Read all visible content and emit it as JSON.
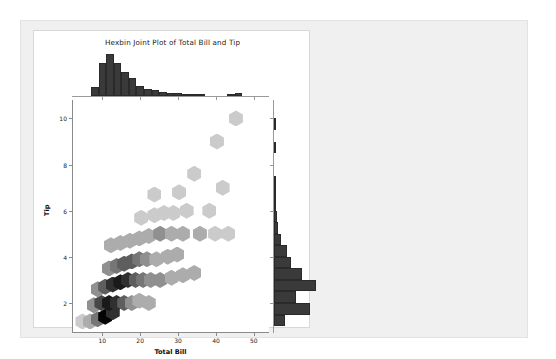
{
  "figure": {
    "title": "Hexbin Joint Plot of Total Bill and Tip",
    "background": "#ffffff",
    "panel_background": "#f0f0f0"
  },
  "chart_data": {
    "type": "heatmap",
    "subtype": "hexbin-joint-plot",
    "title": "Hexbin Joint Plot of Total Bill and Tip",
    "xlabel": "Total Bill",
    "ylabel": "Tip",
    "xlim": [
      2,
      54
    ],
    "ylim": [
      0.7,
      10.8
    ],
    "xticks": [
      10,
      20,
      30,
      40,
      50
    ],
    "yticks": [
      2,
      4,
      6,
      8,
      10
    ],
    "grid": false,
    "legend": null,
    "colormap": "Greys",
    "gridsize": 14,
    "hexbins": [
      {
        "x": 4.5,
        "y": 1.2,
        "count": 1
      },
      {
        "x": 6.5,
        "y": 1.2,
        "count": 2
      },
      {
        "x": 8.5,
        "y": 1.3,
        "count": 4
      },
      {
        "x": 10.5,
        "y": 1.4,
        "count": 9
      },
      {
        "x": 12.5,
        "y": 1.6,
        "count": 7
      },
      {
        "x": 7.5,
        "y": 1.9,
        "count": 3
      },
      {
        "x": 9.5,
        "y": 2.0,
        "count": 6
      },
      {
        "x": 11.5,
        "y": 2.0,
        "count": 8
      },
      {
        "x": 13.5,
        "y": 2.0,
        "count": 7
      },
      {
        "x": 15.5,
        "y": 2.0,
        "count": 5
      },
      {
        "x": 17.5,
        "y": 2.0,
        "count": 3
      },
      {
        "x": 19.5,
        "y": 2.1,
        "count": 2
      },
      {
        "x": 22.0,
        "y": 2.0,
        "count": 2
      },
      {
        "x": 8.5,
        "y": 2.6,
        "count": 3
      },
      {
        "x": 10.5,
        "y": 2.7,
        "count": 5
      },
      {
        "x": 12.5,
        "y": 2.8,
        "count": 7
      },
      {
        "x": 14.5,
        "y": 2.9,
        "count": 8
      },
      {
        "x": 16.5,
        "y": 3.0,
        "count": 7
      },
      {
        "x": 18.5,
        "y": 3.0,
        "count": 5
      },
      {
        "x": 20.5,
        "y": 3.0,
        "count": 4
      },
      {
        "x": 22.5,
        "y": 3.0,
        "count": 3
      },
      {
        "x": 25.0,
        "y": 3.0,
        "count": 3
      },
      {
        "x": 28.0,
        "y": 3.1,
        "count": 2
      },
      {
        "x": 31.0,
        "y": 3.2,
        "count": 2
      },
      {
        "x": 34.0,
        "y": 3.3,
        "count": 2
      },
      {
        "x": 11.5,
        "y": 3.5,
        "count": 3
      },
      {
        "x": 13.5,
        "y": 3.6,
        "count": 4
      },
      {
        "x": 15.5,
        "y": 3.7,
        "count": 5
      },
      {
        "x": 17.5,
        "y": 3.8,
        "count": 5
      },
      {
        "x": 19.5,
        "y": 3.9,
        "count": 4
      },
      {
        "x": 21.5,
        "y": 3.9,
        "count": 3
      },
      {
        "x": 24.0,
        "y": 3.9,
        "count": 2
      },
      {
        "x": 27.0,
        "y": 4.0,
        "count": 2
      },
      {
        "x": 29.5,
        "y": 4.1,
        "count": 2
      },
      {
        "x": 12.0,
        "y": 4.5,
        "count": 2
      },
      {
        "x": 14.5,
        "y": 4.6,
        "count": 2
      },
      {
        "x": 17.0,
        "y": 4.7,
        "count": 2
      },
      {
        "x": 19.5,
        "y": 4.8,
        "count": 2
      },
      {
        "x": 22.0,
        "y": 4.9,
        "count": 2
      },
      {
        "x": 25.0,
        "y": 5.0,
        "count": 3
      },
      {
        "x": 28.0,
        "y": 5.0,
        "count": 2
      },
      {
        "x": 31.0,
        "y": 5.0,
        "count": 2
      },
      {
        "x": 35.5,
        "y": 5.0,
        "count": 2
      },
      {
        "x": 39.5,
        "y": 5.0,
        "count": 1
      },
      {
        "x": 43.0,
        "y": 5.0,
        "count": 1
      },
      {
        "x": 20.0,
        "y": 5.7,
        "count": 1
      },
      {
        "x": 23.5,
        "y": 5.8,
        "count": 1
      },
      {
        "x": 26.0,
        "y": 5.9,
        "count": 1
      },
      {
        "x": 28.5,
        "y": 5.9,
        "count": 1
      },
      {
        "x": 32.0,
        "y": 6.0,
        "count": 1
      },
      {
        "x": 38.0,
        "y": 6.0,
        "count": 1
      },
      {
        "x": 23.5,
        "y": 6.7,
        "count": 1
      },
      {
        "x": 30.0,
        "y": 6.8,
        "count": 1
      },
      {
        "x": 41.5,
        "y": 7.0,
        "count": 1
      },
      {
        "x": 34.0,
        "y": 7.6,
        "count": 1
      },
      {
        "x": 40.0,
        "y": 9.0,
        "count": 1
      },
      {
        "x": 45.0,
        "y": 10.0,
        "count": 1
      }
    ],
    "marginal_x": {
      "label": "Total Bill",
      "bin_edges": [
        3,
        5,
        7,
        9,
        11,
        13,
        15,
        17,
        19,
        21,
        23,
        25,
        27,
        29,
        31,
        33,
        35,
        37,
        39,
        41,
        43,
        45,
        47,
        49,
        51
      ],
      "counts": [
        0,
        0,
        6,
        22,
        28,
        22,
        16,
        12,
        7,
        5,
        4,
        3,
        2,
        2,
        1,
        1,
        1,
        0,
        0,
        0,
        1,
        2,
        0,
        0
      ]
    },
    "marginal_y": {
      "label": "Tip",
      "bin_edges": [
        1.0,
        1.5,
        2.0,
        2.5,
        3.0,
        3.5,
        4.0,
        4.5,
        5.0,
        5.5,
        6.0,
        6.5,
        7.0,
        7.5,
        8.0,
        8.5,
        9.0,
        9.5,
        10.0
      ],
      "counts": [
        8,
        26,
        16,
        30,
        20,
        12,
        9,
        5,
        3,
        2,
        1,
        1,
        1,
        0,
        0,
        1,
        0,
        1
      ]
    }
  },
  "colors": {
    "bar_fill": "#3a3a3a",
    "axis": "#8a8a8a",
    "text": "#111111",
    "panel": "#f0f0f0"
  }
}
